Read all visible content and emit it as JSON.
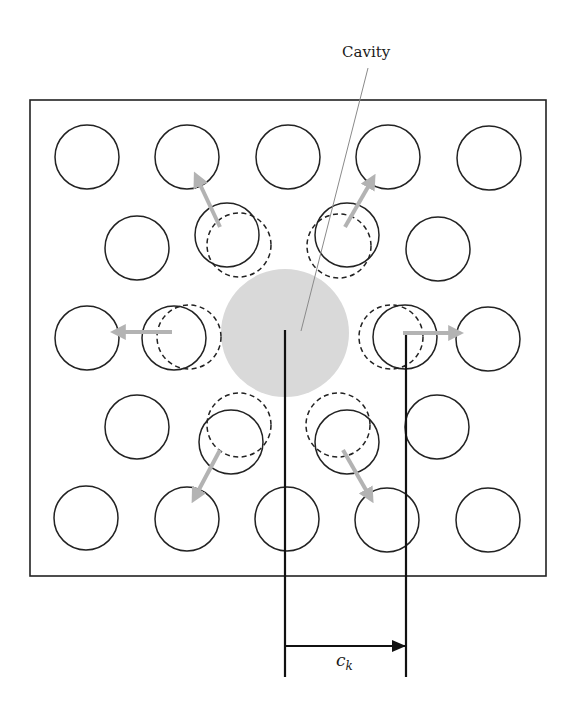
{
  "diagram": {
    "labels": {
      "cavity": "Cavity",
      "distance_symbol": "c",
      "distance_subscript": "k"
    },
    "colors": {
      "outline": "#222222",
      "cavity_fill": "#d9d9d9",
      "arrow": "#b3b3b3",
      "leader": "#8a8a8a",
      "background": "#ffffff"
    },
    "frame": {
      "x": 30,
      "y": 100,
      "width": 516,
      "height": 476
    },
    "particle_radius": 32,
    "cavity": {
      "cx": 285,
      "cy": 333,
      "r": 64
    },
    "lattice_particles": [
      {
        "cx": 87,
        "cy": 157
      },
      {
        "cx": 187,
        "cy": 157
      },
      {
        "cx": 288,
        "cy": 157
      },
      {
        "cx": 388,
        "cy": 157
      },
      {
        "cx": 489,
        "cy": 158
      },
      {
        "cx": 137,
        "cy": 248
      },
      {
        "cx": 438,
        "cy": 249
      },
      {
        "cx": 87,
        "cy": 338
      },
      {
        "cx": 488,
        "cy": 339
      },
      {
        "cx": 137,
        "cy": 427
      },
      {
        "cx": 437,
        "cy": 427
      },
      {
        "cx": 86,
        "cy": 518
      },
      {
        "cx": 187,
        "cy": 519
      },
      {
        "cx": 287,
        "cy": 519
      },
      {
        "cx": 387,
        "cy": 520
      },
      {
        "cx": 488,
        "cy": 520
      }
    ],
    "displaced_particles": [
      {
        "name": "upper-left",
        "solid": {
          "cx": 227,
          "cy": 235
        },
        "dashed": {
          "cx": 239,
          "cy": 245
        },
        "arrow": {
          "x1": 220,
          "y1": 227,
          "x2": 197,
          "y2": 178
        }
      },
      {
        "name": "upper-right",
        "solid": {
          "cx": 347,
          "cy": 235
        },
        "dashed": {
          "cx": 339,
          "cy": 246
        },
        "arrow": {
          "x1": 345,
          "y1": 227,
          "x2": 372,
          "y2": 180
        }
      },
      {
        "name": "left",
        "solid": {
          "cx": 174,
          "cy": 338
        },
        "dashed": {
          "cx": 189,
          "cy": 337
        },
        "arrow": {
          "x1": 172,
          "y1": 332,
          "x2": 117,
          "y2": 332
        }
      },
      {
        "name": "right",
        "solid": {
          "cx": 405,
          "cy": 337
        },
        "dashed": {
          "cx": 391,
          "cy": 337
        },
        "arrow": {
          "x1": 403,
          "y1": 333,
          "x2": 457,
          "y2": 333
        }
      },
      {
        "name": "lower-left",
        "solid": {
          "cx": 231,
          "cy": 442
        },
        "dashed": {
          "cx": 239,
          "cy": 425
        },
        "arrow": {
          "x1": 220,
          "y1": 450,
          "x2": 195,
          "y2": 497
        }
      },
      {
        "name": "lower-right",
        "solid": {
          "cx": 347,
          "cy": 442
        },
        "dashed": {
          "cx": 338,
          "cy": 425
        },
        "arrow": {
          "x1": 343,
          "y1": 450,
          "x2": 370,
          "y2": 497
        }
      }
    ],
    "leader_line": {
      "x1": 368,
      "y1": 68,
      "x2": 301,
      "y2": 331
    },
    "dimension": {
      "left_line": {
        "x": 285,
        "y1": 330,
        "y2": 677
      },
      "right_line": {
        "x": 406,
        "y1": 335,
        "y2": 677
      },
      "arrow_y": 646
    }
  }
}
